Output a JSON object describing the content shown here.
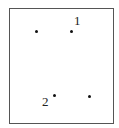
{
  "diagram": {
    "frame": {
      "x": 9,
      "y": 8,
      "width": 104,
      "height": 115,
      "border_color": "#555555"
    },
    "points": [
      {
        "id": "p-top-left",
        "x": 36,
        "y": 31,
        "label": ""
      },
      {
        "id": "p-top-right",
        "x": 71,
        "y": 31,
        "label": "1"
      },
      {
        "id": "p-bottom-left",
        "x": 54,
        "y": 96,
        "label": "2"
      },
      {
        "id": "p-bottom-right",
        "x": 89,
        "y": 96,
        "label": ""
      }
    ],
    "labels": {
      "point_1": "1",
      "point_2": "2"
    },
    "dot_color": "#111111",
    "text_color": "#222222"
  }
}
